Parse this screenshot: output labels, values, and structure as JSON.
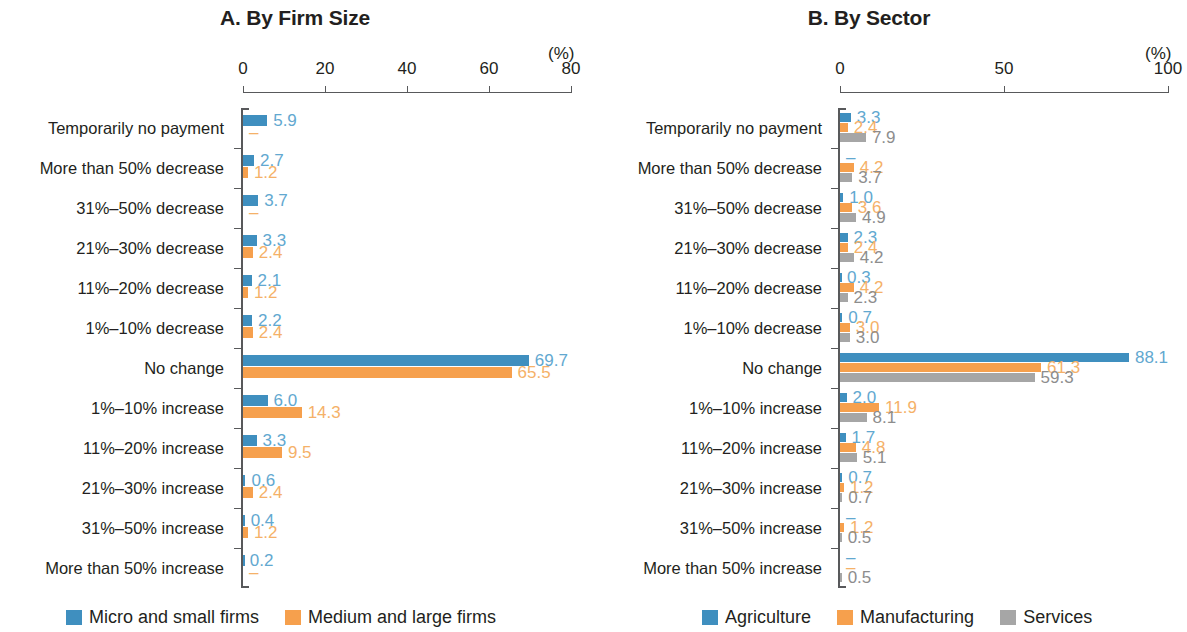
{
  "chart_data": [
    {
      "type": "bar",
      "orientation": "horizontal",
      "title": "A. By Firm Size",
      "xlabel": "(%)",
      "ylabel": "",
      "xlim": [
        0,
        80
      ],
      "xticks": [
        0,
        20,
        40,
        60,
        80
      ],
      "xtick_labels": [
        "0",
        "20",
        "40",
        "60",
        "80"
      ],
      "grid": false,
      "legend_position": "bottom",
      "categories": [
        "Temporarily no payment",
        "More than 50% decrease",
        "31%–50% decrease",
        "21%–30% decrease",
        "11%–20% decrease",
        "1%–10% decrease",
        "No change",
        "1%–10% increase",
        "11%–20% increase",
        "21%–30% increase",
        "31%–50% increase",
        "More than 50% increase"
      ],
      "series": [
        {
          "name": "Micro and small firms",
          "color": "#3f8fbf",
          "values": [
            5.9,
            2.7,
            3.7,
            3.3,
            2.1,
            2.2,
            69.7,
            6.0,
            3.3,
            0.6,
            0.4,
            0.2
          ],
          "labels": [
            "5.9",
            "2.7",
            "3.7",
            "3.3",
            "2.1",
            "2.2",
            "69.7",
            "6.0",
            "3.3",
            "0.6",
            "0.4",
            "0.2"
          ]
        },
        {
          "name": "Medium and large firms",
          "color": "#f6a04d",
          "values": [
            0,
            1.2,
            0,
            2.4,
            1.2,
            2.4,
            65.5,
            14.3,
            9.5,
            2.4,
            1.2,
            0
          ],
          "labels": [
            "–",
            "1.2",
            "–",
            "2.4",
            "1.2",
            "2.4",
            "65.5",
            "14.3",
            "9.5",
            "2.4",
            "1.2",
            "–"
          ]
        }
      ]
    },
    {
      "type": "bar",
      "orientation": "horizontal",
      "title": "B. By Sector",
      "xlabel": "(%)",
      "ylabel": "",
      "xlim": [
        0,
        100
      ],
      "xticks": [
        0,
        50,
        100
      ],
      "xtick_labels": [
        "0",
        "50",
        "100"
      ],
      "grid": false,
      "legend_position": "bottom",
      "categories": [
        "Temporarily no payment",
        "More than 50% decrease",
        "31%–50% decrease",
        "21%–30% decrease",
        "11%–20% decrease",
        "1%–10% decrease",
        "No change",
        "1%–10% increase",
        "11%–20% increase",
        "21%–30% increase",
        "31%–50% increase",
        "More than 50% increase"
      ],
      "series": [
        {
          "name": "Agriculture",
          "color": "#3f8fbf",
          "values": [
            3.3,
            0,
            1.0,
            2.3,
            0.3,
            0.7,
            88.1,
            2.0,
            1.7,
            0.7,
            0,
            0
          ],
          "labels": [
            "3.3",
            "–",
            "1.0",
            "2.3",
            "0.3",
            "0.7",
            "88.1",
            "2.0",
            "1.7",
            "0.7",
            "–",
            "–"
          ]
        },
        {
          "name": "Manufacturing",
          "color": "#f6a04d",
          "values": [
            2.4,
            4.2,
            3.6,
            2.4,
            4.2,
            3.0,
            61.3,
            11.9,
            4.8,
            1.2,
            1.2,
            0
          ],
          "labels": [
            "2.4",
            "4.2",
            "3.6",
            "2.4",
            "4.2",
            "3.0",
            "61.3",
            "11.9",
            "4.8",
            "1.2",
            "1.2",
            "–"
          ]
        },
        {
          "name": "Services",
          "color": "#a6a6a6",
          "values": [
            7.9,
            3.7,
            4.9,
            4.2,
            2.3,
            3.0,
            59.3,
            8.1,
            5.1,
            0.7,
            0.5,
            0.5
          ],
          "labels": [
            "7.9",
            "3.7",
            "4.9",
            "4.2",
            "2.3",
            "3.0",
            "59.3",
            "8.1",
            "5.1",
            "0.7",
            "0.5",
            "0.5"
          ]
        }
      ]
    }
  ],
  "panel_a": {
    "title": "A. By Firm Size",
    "unit": "(%)",
    "legend": [
      "Micro and small firms",
      "Medium and large firms"
    ]
  },
  "panel_b": {
    "title": "B. By Sector",
    "unit": "(%)",
    "legend": [
      "Agriculture",
      "Manufacturing",
      "Services"
    ]
  },
  "colors": {
    "series_blue": "#3f8fbf",
    "series_orange": "#f6a04d",
    "series_gray": "#a6a6a6",
    "label_blue": "#62a8d0",
    "label_orange": "#f5b168",
    "label_gray": "#8d8d8d",
    "axis": "#58595b",
    "text": "#231f20"
  }
}
